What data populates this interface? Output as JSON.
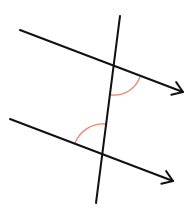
{
  "diagram": {
    "title": "",
    "colors": {
      "line": "#111111",
      "angle_arc": "#e8876a",
      "background": "#ffffff"
    },
    "parallel_lines": [
      {
        "name": "upper-parallel-line",
        "x1": 20,
        "y1": 30,
        "x2": 183,
        "y2": 92,
        "arrow": true
      },
      {
        "name": "lower-parallel-line",
        "x1": 10,
        "y1": 119,
        "x2": 173,
        "y2": 181,
        "arrow": true
      }
    ],
    "transversal": {
      "x1": 120,
      "y1": 16,
      "x2": 96,
      "y2": 203
    },
    "angle_marks": [
      {
        "name": "upper-angle-arc",
        "path": "M140,77 A28,28 0 0 1 111,95"
      },
      {
        "name": "lower-angle-arc",
        "path": "M75,143 A30,30 0 0 1 105,124"
      }
    ]
  }
}
